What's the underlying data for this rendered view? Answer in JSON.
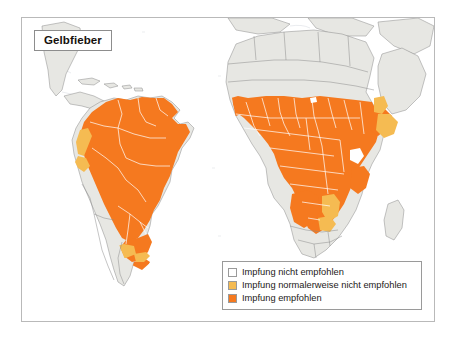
{
  "figure": {
    "title": "Gelbfieber"
  },
  "legend": {
    "items": [
      {
        "label": "Impfung nicht empfohlen",
        "color": "#ffffff"
      },
      {
        "label": "Impfung normalerweise nicht empfohlen",
        "color": "#f5bb52"
      },
      {
        "label": "Impfung empfohlen",
        "color": "#f5791f"
      }
    ]
  },
  "colors": {
    "sea": "#ffffff",
    "land_unshaded": "#e7e7e3",
    "land_border": "#8a8a8a",
    "region_border": "#ffffff",
    "recommended": "#f5791f",
    "not_usually_recommended": "#f5bb52",
    "frame": "#b9b9b9",
    "text": "#16110d"
  },
  "maps": [
    {
      "name": "south-america",
      "recommended_countries": [
        "Brasilien",
        "Kolumbien",
        "Venezuela",
        "Peru",
        "Bolivien",
        "Ecuador",
        "Guyana",
        "Suriname",
        "Franzoesisch-Guayana",
        "Panama",
        "Trinidad und Tobago"
      ],
      "not_usually_recommended_countries": [
        "Ecuador (Kueste)",
        "Peru (Kueste)",
        "Paraguay",
        "Nordargentinien",
        "Suedbrasilien"
      ]
    },
    {
      "name": "africa",
      "recommended_countries": [
        "Senegal",
        "Gambia",
        "Guinea-Bissau",
        "Guinea",
        "Sierra Leone",
        "Liberia",
        "Cote d'Ivoire",
        "Ghana",
        "Togo",
        "Benin",
        "Nigeria",
        "Mali",
        "Burkina Faso",
        "Niger",
        "Tschad",
        "Sudan",
        "Suedsudan",
        "Aethiopien",
        "Zentralafrikanische Republik",
        "Kamerun",
        "Aequatorialguinea",
        "Gabun",
        "Kongo",
        "Demokratische Republik Kongo",
        "Uganda",
        "Kenia",
        "Angola",
        "Mauretanien"
      ],
      "not_usually_recommended_countries": [
        "Eritrea",
        "Somalia (Teile)",
        "Sambia",
        "Tansania",
        "Aethiopien (Tiefland)"
      ]
    }
  ]
}
